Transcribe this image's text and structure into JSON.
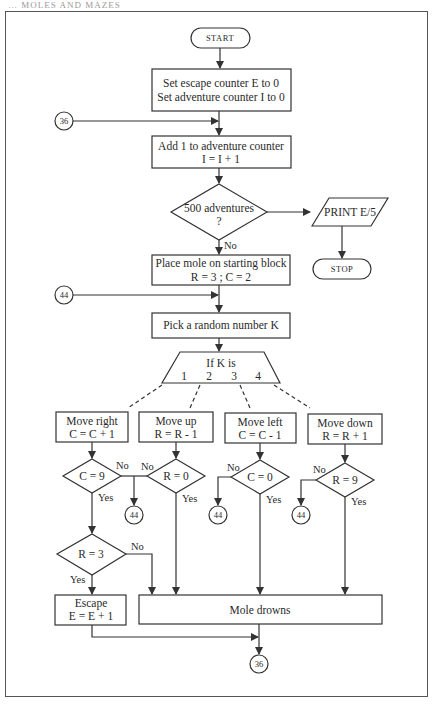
{
  "header": {
    "text": "… MOLES AND MAZES"
  },
  "nodes": {
    "start": {
      "label": "START"
    },
    "init": {
      "line1": "Set escape counter E to 0",
      "line2": "Set adventure counter I to 0"
    },
    "increment": {
      "line1": "Add 1 to adventure counter",
      "line2": "I = I + 1"
    },
    "check_500": {
      "line1": "500 adventures",
      "line2": "?"
    },
    "print": {
      "label": "PRINT E/5"
    },
    "stop": {
      "label": "STOP"
    },
    "place_mole": {
      "line1": "Place mole on starting block",
      "line2": "R = 3 ; C = 2"
    },
    "pick_random": {
      "label": "Pick a random number K"
    },
    "switch_k": {
      "line1": "If K is",
      "cases": [
        "1",
        "2",
        "3",
        "4"
      ]
    },
    "move_right": {
      "line1": "Move right",
      "line2": "C = C + 1"
    },
    "move_up": {
      "line1": "Move up",
      "line2": "R = R - 1"
    },
    "move_left": {
      "line1": "Move left",
      "line2": "C = C - 1"
    },
    "move_down": {
      "line1": "Move down",
      "line2": "R = R + 1"
    },
    "check_c9": {
      "label": "C = 9"
    },
    "check_r0": {
      "label": "R = 0"
    },
    "check_c0": {
      "label": "C = 0"
    },
    "check_r9": {
      "label": "R = 9"
    },
    "check_r3": {
      "label": "R = 3"
    },
    "escape": {
      "line1": "Escape",
      "line2": "E = E + 1"
    },
    "drowns": {
      "label": "Mole drowns"
    }
  },
  "connectors": {
    "c36_top": "36",
    "c44_top": "44",
    "c44_a": "44",
    "c44_b": "44",
    "c44_c": "44",
    "c36_bottom": "36"
  },
  "branch_labels": {
    "no": "No",
    "yes": "Yes"
  }
}
